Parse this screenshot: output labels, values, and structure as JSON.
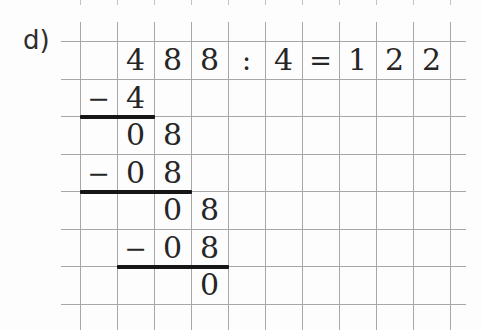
{
  "exercise": {
    "label": "d)",
    "equation": "488 : 4 = 122",
    "dividend": "488",
    "divisor": "4",
    "quotient": "122"
  },
  "colors": {
    "grid_line": "#a7a7a7",
    "tick_line": "#c3c3c3",
    "rule_line": "#161616",
    "text": "#262626",
    "label": "#2e2e2e",
    "background": "#fdfdfd"
  },
  "cells": [
    {
      "text": "4",
      "row": 1,
      "col": 2
    },
    {
      "text": "8",
      "row": 1,
      "col": 3
    },
    {
      "text": "8",
      "row": 1,
      "col": 4
    },
    {
      "text": ":",
      "row": 1,
      "col": 5
    },
    {
      "text": "4",
      "row": 1,
      "col": 6
    },
    {
      "text": "=",
      "row": 1,
      "col": 7
    },
    {
      "text": "1",
      "row": 1,
      "col": 8
    },
    {
      "text": "2",
      "row": 1,
      "col": 9
    },
    {
      "text": "2",
      "row": 1,
      "col": 10
    },
    {
      "text": "−",
      "row": 2,
      "col": 1
    },
    {
      "text": "4",
      "row": 2,
      "col": 2
    },
    {
      "text": "0",
      "row": 3,
      "col": 2
    },
    {
      "text": "8",
      "row": 3,
      "col": 3
    },
    {
      "text": "−",
      "row": 4,
      "col": 1
    },
    {
      "text": "0",
      "row": 4,
      "col": 2
    },
    {
      "text": "8",
      "row": 4,
      "col": 3
    },
    {
      "text": "0",
      "row": 5,
      "col": 3
    },
    {
      "text": "8",
      "row": 5,
      "col": 4
    },
    {
      "text": "−",
      "row": 6,
      "col": 2
    },
    {
      "text": "0",
      "row": 6,
      "col": 3
    },
    {
      "text": "8",
      "row": 6,
      "col": 4
    },
    {
      "text": "0",
      "row": 7,
      "col": 4
    }
  ]
}
